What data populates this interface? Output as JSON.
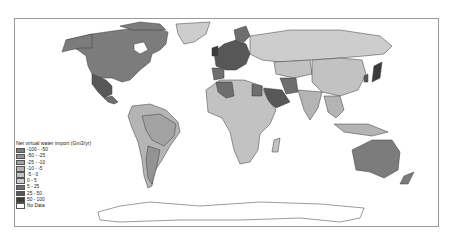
{
  "map": {
    "type": "choropleth",
    "subject": "Net virtual water import by country",
    "projection": "world, Pacific-split equirectangular-like"
  },
  "legend": {
    "title": "Net virtual water import (Gm3/yr)",
    "items": [
      {
        "label": "-100 - -50",
        "color": "#7c7c7c"
      },
      {
        "label": "-50 - -25",
        "color": "#939393"
      },
      {
        "label": "-25 - -10",
        "color": "#a3a3a3"
      },
      {
        "label": "-10 - -5",
        "color": "#b4b4b4"
      },
      {
        "label": "-5 - 0",
        "color": "#c2c2c2"
      },
      {
        "label": "0 - 5",
        "color": "#cdcdcd"
      },
      {
        "label": "5 - 25",
        "color": "#6e6e6e"
      },
      {
        "label": "25 - 50",
        "color": "#575757"
      },
      {
        "label": "50 - 100",
        "color": "#3c3c3c"
      },
      {
        "label": "No Data",
        "color": "#ffffff"
      }
    ]
  },
  "colors": {
    "frame": "#9a9a9a",
    "border": "#3a3a3a"
  }
}
